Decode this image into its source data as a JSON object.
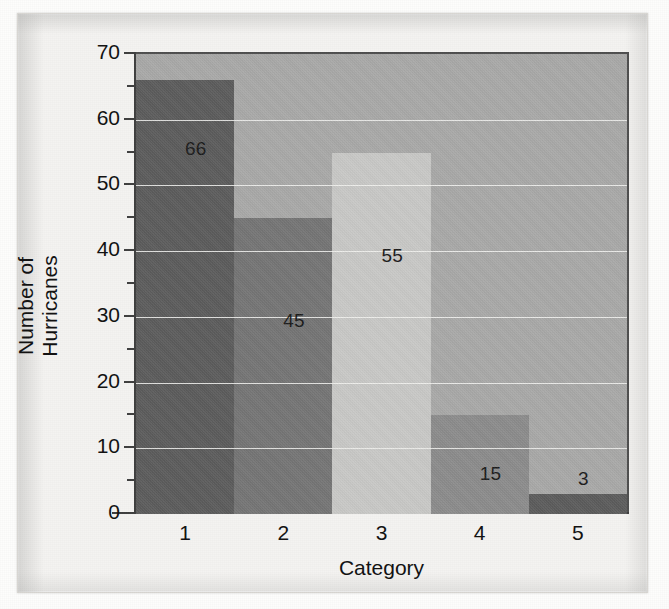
{
  "chart_data": {
    "type": "bar",
    "title": "",
    "xlabel": "Category",
    "ylabel": "Number of Hurricanes",
    "categories": [
      "1",
      "2",
      "3",
      "4",
      "5"
    ],
    "values": [
      66,
      45,
      55,
      15,
      3
    ],
    "value_labels": [
      "66",
      "45",
      "55",
      "15",
      "3"
    ],
    "ylim": [
      0,
      70
    ],
    "ytick_labels": [
      "0",
      "10",
      "20",
      "30",
      "40",
      "50",
      "60",
      "70"
    ],
    "ytick_values": [
      0,
      10,
      20,
      30,
      40,
      50,
      60,
      70
    ],
    "yminor_values": [
      5,
      15,
      25,
      35,
      45,
      55,
      65
    ],
    "gridlines": [
      10,
      20,
      30,
      40,
      50,
      60
    ],
    "grid": true,
    "legend": "none",
    "bar_colors": [
      "#5c5c5c",
      "#757575",
      "#c9c9c7",
      "#8c8c8c",
      "#5c5c5c"
    ],
    "plot_background": "#a9a9a8",
    "gridline_color": "#f2f2f0",
    "axis_color": "#3f3f3f",
    "label_color": "#1a1a1a",
    "figure_background": "#f4f3f1"
  }
}
